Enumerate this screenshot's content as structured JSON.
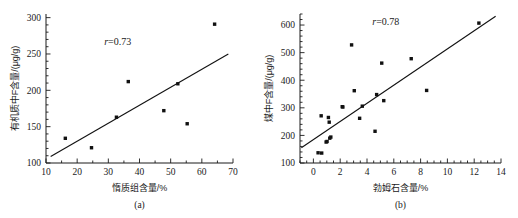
{
  "figure": {
    "panels": [
      {
        "caption": "(a)",
        "annotation_r": "r=0.73",
        "annotation_r_symbol": "r",
        "annotation_r_value": "=0.73",
        "xlabel": "惰质组含量/%",
        "ylabel": "有机质中F含量/(μg/g)",
        "xticks": [
          "10",
          "20",
          "30",
          "40",
          "50",
          "60",
          "70"
        ],
        "yticks": [
          "100",
          "150",
          "200",
          "250",
          "300"
        ]
      },
      {
        "caption": "(b)",
        "annotation_r": "r=0.78",
        "annotation_r_symbol": "r",
        "annotation_r_value": "=0.78",
        "xlabel": "勃姆石含量/%",
        "ylabel": "煤中F含量/(μg/g)",
        "xticks": [
          "0",
          "2",
          "4",
          "6",
          "8",
          "10",
          "12",
          "14"
        ],
        "yticks": [
          "100",
          "200",
          "300",
          "400",
          "500",
          "600"
        ]
      }
    ]
  },
  "chart_data": [
    {
      "type": "scatter",
      "title": "",
      "panel": "(a)",
      "xlabel": "惰质组含量/%",
      "ylabel": "有机质中F含量/(μg/g)",
      "xlim": [
        10,
        70
      ],
      "ylim": [
        100,
        305
      ],
      "xticks": [
        10,
        20,
        30,
        40,
        50,
        60,
        70
      ],
      "yticks": [
        100,
        150,
        200,
        250,
        300
      ],
      "xminor_step": 5,
      "yminor_step": 10,
      "grid": false,
      "legend": null,
      "annotations": [
        {
          "text": "r=0.73",
          "x": 33,
          "y": 262
        }
      ],
      "points": [
        {
          "x": 16.2,
          "y": 134
        },
        {
          "x": 24.6,
          "y": 121
        },
        {
          "x": 32.6,
          "y": 163
        },
        {
          "x": 36.4,
          "y": 212
        },
        {
          "x": 47.8,
          "y": 172
        },
        {
          "x": 52.3,
          "y": 209
        },
        {
          "x": 55.3,
          "y": 154
        },
        {
          "x": 64.1,
          "y": 291
        }
      ],
      "trendline": {
        "x0": 11.5,
        "y0": 109,
        "x1": 68.5,
        "y1": 250,
        "r": 0.73
      }
    },
    {
      "type": "scatter",
      "title": "",
      "panel": "(b)",
      "xlabel": "勃姆石含量/%",
      "ylabel": "煤中F含量/(μg/g)",
      "xlim": [
        -1.0,
        14
      ],
      "ylim": [
        100,
        640
      ],
      "xticks": [
        0,
        2,
        4,
        6,
        8,
        10,
        12,
        14
      ],
      "yticks": [
        100,
        200,
        300,
        400,
        500,
        600
      ],
      "xminor_step": 0.5,
      "yminor_step": 20,
      "grid": false,
      "legend": null,
      "annotations": [
        {
          "text": "r=0.78",
          "x": 5.4,
          "y": 600
        }
      ],
      "points": [
        {
          "x": 0.35,
          "y": 137
        },
        {
          "x": 0.62,
          "y": 136
        },
        {
          "x": 0.58,
          "y": 271
        },
        {
          "x": 0.95,
          "y": 176
        },
        {
          "x": 1.02,
          "y": 178
        },
        {
          "x": 1.12,
          "y": 265
        },
        {
          "x": 1.18,
          "y": 248
        },
        {
          "x": 1.22,
          "y": 190
        },
        {
          "x": 1.3,
          "y": 194
        },
        {
          "x": 2.15,
          "y": 304
        },
        {
          "x": 2.2,
          "y": 303
        },
        {
          "x": 2.85,
          "y": 528
        },
        {
          "x": 3.05,
          "y": 362
        },
        {
          "x": 3.45,
          "y": 262
        },
        {
          "x": 3.65,
          "y": 306
        },
        {
          "x": 4.6,
          "y": 215
        },
        {
          "x": 4.72,
          "y": 348
        },
        {
          "x": 5.1,
          "y": 462
        },
        {
          "x": 5.25,
          "y": 326
        },
        {
          "x": 7.3,
          "y": 478
        },
        {
          "x": 8.45,
          "y": 363
        },
        {
          "x": 12.35,
          "y": 607
        }
      ],
      "trendline": {
        "x0": -0.9,
        "y0": 155,
        "x1": 13.6,
        "y1": 632,
        "r": 0.78
      }
    }
  ]
}
